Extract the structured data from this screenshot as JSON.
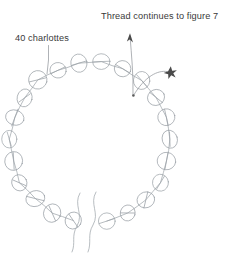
{
  "figure": {
    "kind": "beading-diagram",
    "background_color": "#ffffff",
    "line_color": "#9aa0a6",
    "leader_color": "#8d9196",
    "text_color": "#3a3a3a",
    "marker_color": "#4a4a4a"
  },
  "annotations": {
    "bead_count_label": "40 charlottes",
    "thread_label": "Thread continues to figure 7",
    "star_marker": "✶"
  },
  "ring": {
    "center_x": 90,
    "center_y": 142,
    "radius": 80,
    "bead_radius": 8.5,
    "bead_count": 22,
    "gap_start_deg": 78,
    "gap_end_deg": 102,
    "description": "closed loop of charlotte seed beads strung on thread"
  },
  "tails": {
    "count": 2,
    "description": "two wavy thread tails hanging from the bottom of the ring"
  },
  "leaders": {
    "bead_label_leader": "line from '40 charlottes' down to upper-left bead",
    "thread_label_arrow": "arrow from ring up toward 'Thread continues to figure 7'",
    "star_leader": "curved line from ring junction out to star marker"
  }
}
